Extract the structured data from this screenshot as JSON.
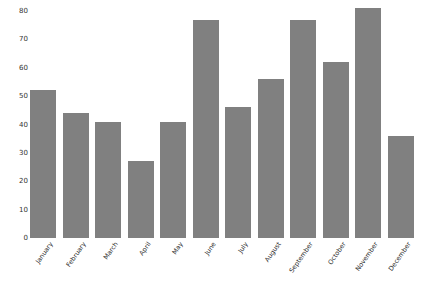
{
  "chart_data": {
    "type": "bar",
    "title": "",
    "subtitle": "",
    "xlabel": "",
    "ylabel": "",
    "categories": [
      "January",
      "February",
      "March",
      "April",
      "May",
      "June",
      "July",
      "August",
      "September",
      "October",
      "November",
      "December"
    ],
    "values": [
      52,
      44,
      41,
      27,
      41,
      77,
      46,
      56,
      77,
      62,
      81,
      36
    ],
    "series": [
      {
        "name": "",
        "values": [
          52,
          44,
          41,
          27,
          41,
          77,
          46,
          56,
          77,
          62,
          81,
          36
        ]
      }
    ],
    "ylim": [
      0,
      80
    ],
    "yticks": [
      0,
      10,
      20,
      30,
      40,
      50,
      60,
      70,
      80
    ],
    "ytick_labels": [
      "0",
      "10",
      "20",
      "30",
      "40",
      "50",
      "60",
      "70",
      "80"
    ],
    "grid": false,
    "legend": false,
    "legend_position": "none",
    "bar_color": "#808080",
    "background_color": "#ffffff",
    "xtick_rotation": -55
  }
}
